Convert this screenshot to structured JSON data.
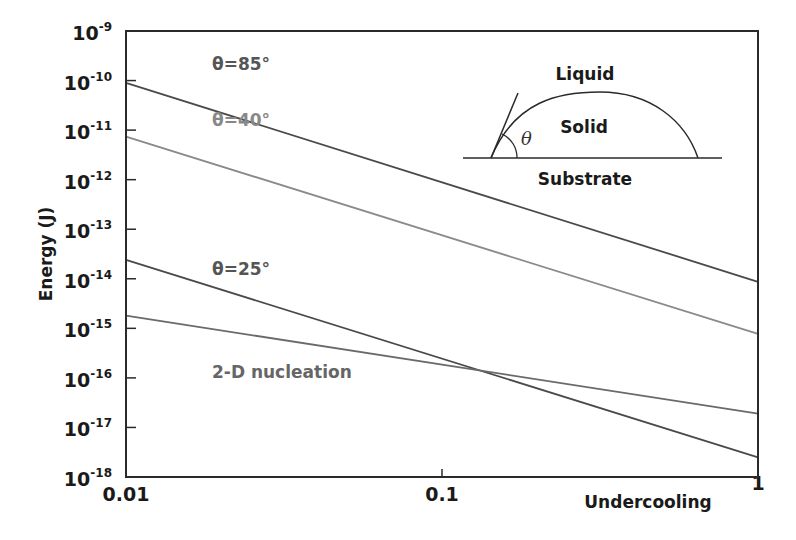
{
  "chart_data": {
    "type": "line",
    "title": "",
    "xlabel": "Undercooling",
    "ylabel": "Energy (J)",
    "xscale": "log",
    "yscale": "log",
    "xlim": [
      0.01,
      1
    ],
    "ylim": [
      1e-18,
      1e-09
    ],
    "x_ticks": [
      {
        "value": 0.01,
        "label": "0.01"
      },
      {
        "value": 0.1,
        "label": "0.1"
      },
      {
        "value": 1,
        "label": "1"
      }
    ],
    "y_ticks": [
      {
        "exp": -9,
        "base": "10",
        "sup": "-9"
      },
      {
        "exp": -10,
        "base": "10",
        "sup": "-10"
      },
      {
        "exp": -11,
        "base": "10",
        "sup": "-11"
      },
      {
        "exp": -12,
        "base": "10",
        "sup": "-12"
      },
      {
        "exp": -13,
        "base": "10",
        "sup": "-13"
      },
      {
        "exp": -14,
        "base": "10",
        "sup": "-14"
      },
      {
        "exp": -15,
        "base": "10",
        "sup": "-15"
      },
      {
        "exp": -16,
        "base": "10",
        "sup": "-16"
      },
      {
        "exp": -17,
        "base": "10",
        "sup": "-17"
      },
      {
        "exp": -18,
        "base": "10",
        "sup": "-18"
      }
    ],
    "grid": false,
    "series": [
      {
        "name": "θ=85°",
        "x": [
          0.01,
          1
        ],
        "values": [
          9e-11,
          8.7e-15
        ],
        "color": "#4a4a4a",
        "label_color": "#555555",
        "label_pos": [
          0.013,
          2.2e-10
        ]
      },
      {
        "name": "θ=40°",
        "x": [
          0.01,
          1
        ],
        "values": [
          7.4e-12,
          7.7e-16
        ],
        "color": "#8a8a8a",
        "label_color": "#888888",
        "label_pos": [
          0.013,
          1.6e-11
        ]
      },
      {
        "name": "θ=25°",
        "x": [
          0.01,
          1
        ],
        "values": [
          2.4e-14,
          2.5e-18
        ],
        "color": "#4a4a4a",
        "label_color": "#555555",
        "label_pos": [
          0.013,
          1.6e-14
        ]
      },
      {
        "name": "2-D nucleation",
        "x": [
          0.01,
          1
        ],
        "values": [
          1.8e-15,
          1.9e-17
        ],
        "color": "#6a6a6a",
        "label_color": "#666666",
        "label_pos": [
          0.013,
          1.3e-16
        ]
      }
    ],
    "annotations": {
      "crossing_point": {
        "x": 0.14,
        "y": 1.5e-16,
        "note": "θ=25° line crosses 2-D nucleation line"
      }
    },
    "inset": {
      "labels": {
        "liquid": "Liquid",
        "solid": "Solid",
        "substrate": "Substrate",
        "angle": "θ"
      }
    }
  }
}
